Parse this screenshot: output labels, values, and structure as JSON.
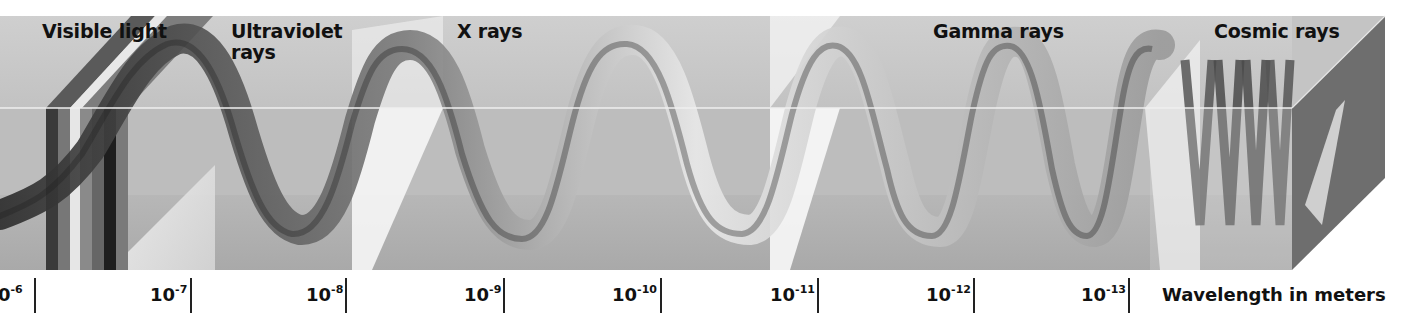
{
  "diagram": {
    "regions": [
      {
        "label": "Visible light"
      },
      {
        "label_line1": "Ultraviolet",
        "label_line2": "rays"
      },
      {
        "label": "X rays"
      },
      {
        "label": "Gamma rays"
      },
      {
        "label": "Cosmic rays"
      }
    ],
    "axis": {
      "title": "Wavelength in meters",
      "ticks": [
        {
          "base": "10",
          "exp": "-6",
          "visible_text": "0"
        },
        {
          "base": "10",
          "exp": "-7"
        },
        {
          "base": "10",
          "exp": "-8"
        },
        {
          "base": "10",
          "exp": "-9"
        },
        {
          "base": "10",
          "exp": "-10"
        },
        {
          "base": "10",
          "exp": "-11"
        },
        {
          "base": "10",
          "exp": "-12"
        },
        {
          "base": "10",
          "exp": "-13"
        }
      ]
    },
    "colors": {
      "panel_gray": "#c9c9c9",
      "floor_gray": "#b3b3b3",
      "side_face": "#6e6e6e",
      "wave_dark": "#2a2a2a",
      "wave_light": "#f4f4f4"
    }
  }
}
